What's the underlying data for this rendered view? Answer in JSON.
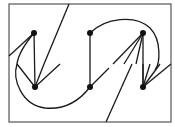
{
  "diagram": {
    "type": "graph-drawing",
    "frame": {
      "x": 9,
      "y": 4,
      "width": 162,
      "height": 118
    },
    "nodes": [
      {
        "id": "a",
        "x": 34,
        "y": 33
      },
      {
        "id": "b",
        "x": 35,
        "y": 87
      },
      {
        "id": "c",
        "x": 90,
        "y": 33
      },
      {
        "id": "d",
        "x": 90,
        "y": 87
      },
      {
        "id": "e",
        "x": 143,
        "y": 33
      },
      {
        "id": "f",
        "x": 143,
        "y": 87
      }
    ],
    "edges": [
      {
        "from": "a",
        "to": "b"
      },
      {
        "from": "c",
        "to": "d"
      },
      {
        "from": "e",
        "to": "f"
      },
      {
        "from": "b",
        "to": "a"
      },
      {
        "from": "b",
        "to": "c"
      },
      {
        "from": "d",
        "to": "e"
      }
    ],
    "colors": {
      "stroke": "#1a1a1a",
      "frame": "#555555",
      "background": "#ffffff"
    }
  }
}
